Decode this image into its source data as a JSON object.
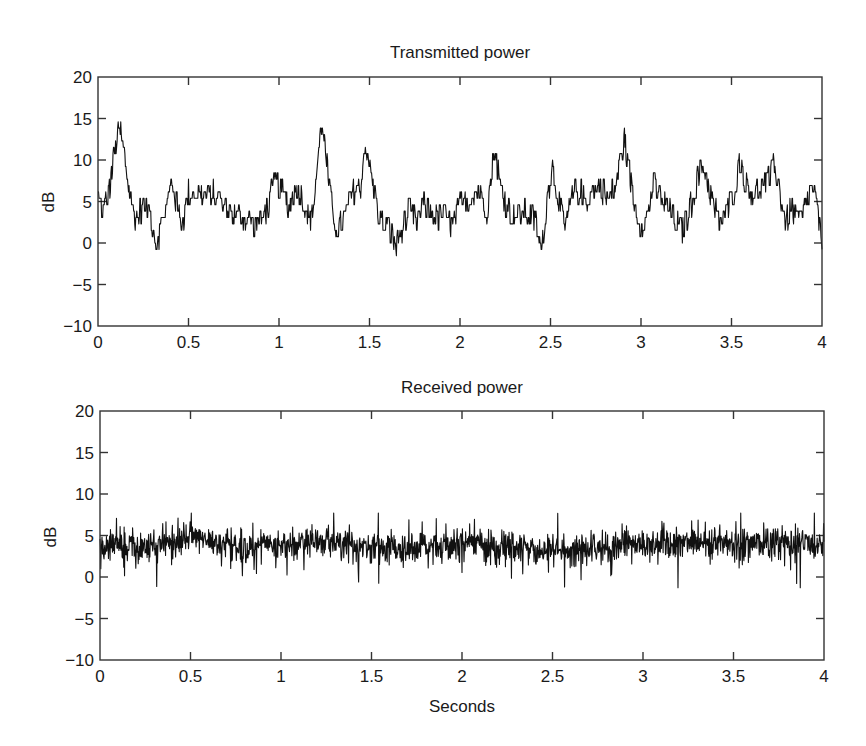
{
  "chart_data": [
    {
      "type": "line",
      "title": "Transmitted power",
      "xlabel": "",
      "ylabel": "dB",
      "xlim": [
        0,
        4
      ],
      "ylim": [
        -10,
        20
      ],
      "xticks": [
        0,
        0.5,
        1,
        1.5,
        2,
        2.5,
        3,
        3.5,
        4
      ],
      "xtick_labels": [
        "0",
        "0.5",
        "1",
        "1.5",
        "2",
        "2.5",
        "3",
        "3.5",
        "4"
      ],
      "yticks": [
        -10,
        -5,
        0,
        5,
        10,
        15,
        20
      ],
      "ytick_labels": [
        "−10",
        "−5",
        "0",
        "5",
        "10",
        "15",
        "20"
      ],
      "grid": false,
      "series": [
        {
          "name": "Transmitted power",
          "noise_amplitude_db": 1.6,
          "x": [
            0.0,
            0.03,
            0.06,
            0.09,
            0.12,
            0.15,
            0.18,
            0.21,
            0.25,
            0.29,
            0.32,
            0.35,
            0.38,
            0.41,
            0.44,
            0.47,
            0.5,
            0.55,
            0.6,
            0.65,
            0.7,
            0.75,
            0.8,
            0.85,
            0.9,
            0.94,
            0.98,
            1.02,
            1.06,
            1.1,
            1.14,
            1.18,
            1.21,
            1.24,
            1.27,
            1.3,
            1.33,
            1.37,
            1.41,
            1.45,
            1.48,
            1.51,
            1.55,
            1.6,
            1.65,
            1.68,
            1.72,
            1.76,
            1.8,
            1.84,
            1.88,
            1.92,
            1.96,
            2.0,
            2.05,
            2.1,
            2.15,
            2.19,
            2.23,
            2.28,
            2.33,
            2.38,
            2.42,
            2.45,
            2.48,
            2.51,
            2.55,
            2.58,
            2.62,
            2.66,
            2.7,
            2.74,
            2.78,
            2.82,
            2.86,
            2.91,
            2.95,
            2.99,
            3.03,
            3.07,
            3.11,
            3.15,
            3.19,
            3.23,
            3.27,
            3.31,
            3.35,
            3.39,
            3.43,
            3.47,
            3.51,
            3.55,
            3.59,
            3.63,
            3.67,
            3.71,
            3.74,
            3.77,
            3.8,
            3.83,
            3.86,
            3.89,
            3.92,
            3.95,
            3.98,
            4.0
          ],
          "y": [
            5.5,
            4.0,
            6.0,
            10.5,
            14.0,
            10.0,
            5.0,
            3.0,
            4.5,
            3.5,
            0.0,
            2.0,
            4.5,
            7.5,
            4.0,
            2.5,
            6.0,
            6.0,
            5.5,
            6.0,
            4.5,
            3.5,
            3.0,
            2.5,
            2.5,
            4.5,
            7.5,
            6.0,
            4.5,
            7.0,
            4.5,
            2.5,
            9.0,
            15.0,
            8.0,
            3.0,
            1.5,
            3.5,
            6.5,
            6.5,
            12.5,
            8.0,
            3.5,
            2.0,
            -0.5,
            1.5,
            4.0,
            2.5,
            4.5,
            4.0,
            3.0,
            3.5,
            2.0,
            4.5,
            5.5,
            6.5,
            4.0,
            11.5,
            6.0,
            3.5,
            3.5,
            3.5,
            2.5,
            -1.0,
            5.0,
            9.5,
            4.5,
            1.5,
            5.5,
            6.5,
            5.0,
            6.5,
            7.0,
            5.0,
            7.0,
            12.5,
            6.5,
            2.5,
            3.0,
            7.0,
            5.5,
            4.0,
            2.5,
            1.5,
            4.0,
            7.5,
            9.5,
            5.5,
            2.5,
            3.5,
            6.0,
            10.0,
            6.0,
            6.0,
            7.0,
            7.5,
            9.5,
            6.0,
            2.0,
            4.5,
            3.0,
            3.0,
            5.5,
            7.0,
            3.0,
            -1.0
          ]
        }
      ]
    },
    {
      "type": "line",
      "title": "Received power",
      "xlabel": "Seconds",
      "ylabel": "dB",
      "xlim": [
        0,
        4
      ],
      "ylim": [
        -10,
        20
      ],
      "xticks": [
        0,
        0.5,
        1,
        1.5,
        2,
        2.5,
        3,
        3.5,
        4
      ],
      "xtick_labels": [
        "0",
        "0.5",
        "1",
        "1.5",
        "2",
        "2.5",
        "3",
        "3.5",
        "4"
      ],
      "yticks": [
        -10,
        -5,
        0,
        5,
        10,
        15,
        20
      ],
      "ytick_labels": [
        "−10",
        "−5",
        "0",
        "5",
        "10",
        "15",
        "20"
      ],
      "grid": false,
      "series": [
        {
          "name": "Received power",
          "mean_db": 3.7,
          "noise_amplitude_db": 1.3,
          "min_db": -1.3,
          "max_db": 7.7,
          "x": [
            0.0,
            0.25,
            0.55,
            0.8,
            1.25,
            1.7,
            2.0,
            2.45,
            3.0,
            3.2,
            3.5,
            4.0
          ],
          "y": [
            3.7,
            3.5,
            4.6,
            3.6,
            4.2,
            3.2,
            4.3,
            3.0,
            4.0,
            4.3,
            4.1,
            3.8
          ]
        }
      ]
    }
  ],
  "plots": {
    "top": {
      "title": "Transmitted power",
      "ylabel": "dB"
    },
    "bottom": {
      "title": "Received power",
      "ylabel": "dB",
      "xlabel": "Seconds"
    }
  },
  "colors": {
    "line": "#111111",
    "axes": "#333333",
    "background": "#ffffff"
  }
}
